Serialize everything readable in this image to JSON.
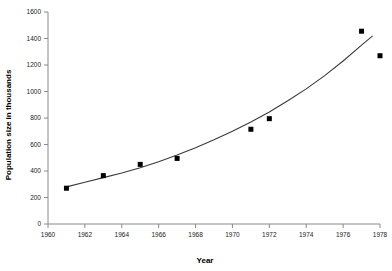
{
  "chart_data": {
    "type": "scatter",
    "title": "",
    "xlabel": "Year",
    "ylabel": "Population size in thousands",
    "xlim": [
      1960,
      1978
    ],
    "ylim": [
      0,
      1600
    ],
    "grid": false,
    "legend": "none",
    "x_ticks": [
      1960,
      1962,
      1964,
      1966,
      1968,
      1970,
      1972,
      1974,
      1976,
      1978
    ],
    "y_ticks": [
      0,
      200,
      400,
      600,
      800,
      1000,
      1200,
      1400,
      1600
    ],
    "x_tick_labels": [
      "1960",
      "1962",
      "1964",
      "1966",
      "1968",
      "1970",
      "1972",
      "1974",
      "1976",
      "1978"
    ],
    "y_tick_labels": [
      "0",
      "200",
      "400",
      "600",
      "800",
      "1000",
      "1200",
      "1400",
      "1600"
    ],
    "series": [
      {
        "name": "Observed population",
        "marker": "square",
        "color": "#000000",
        "x": [
          1961,
          1963,
          1965,
          1967,
          1971,
          1972,
          1977,
          1978
        ],
        "values": [
          270,
          365,
          450,
          495,
          715,
          795,
          1455,
          1270
        ]
      },
      {
        "name": "Fitted exponential trend",
        "marker": "none",
        "color": "#3a3a3a",
        "x": [
          1961,
          1962,
          1963,
          1964,
          1965,
          1966,
          1967,
          1968,
          1969,
          1970,
          1971,
          1972,
          1973,
          1974,
          1975,
          1976,
          1977,
          1977.6
        ],
        "values": [
          280,
          315,
          350,
          385,
          425,
          470,
          520,
          575,
          635,
          700,
          770,
          845,
          930,
          1020,
          1120,
          1230,
          1350,
          1420
        ]
      }
    ]
  }
}
